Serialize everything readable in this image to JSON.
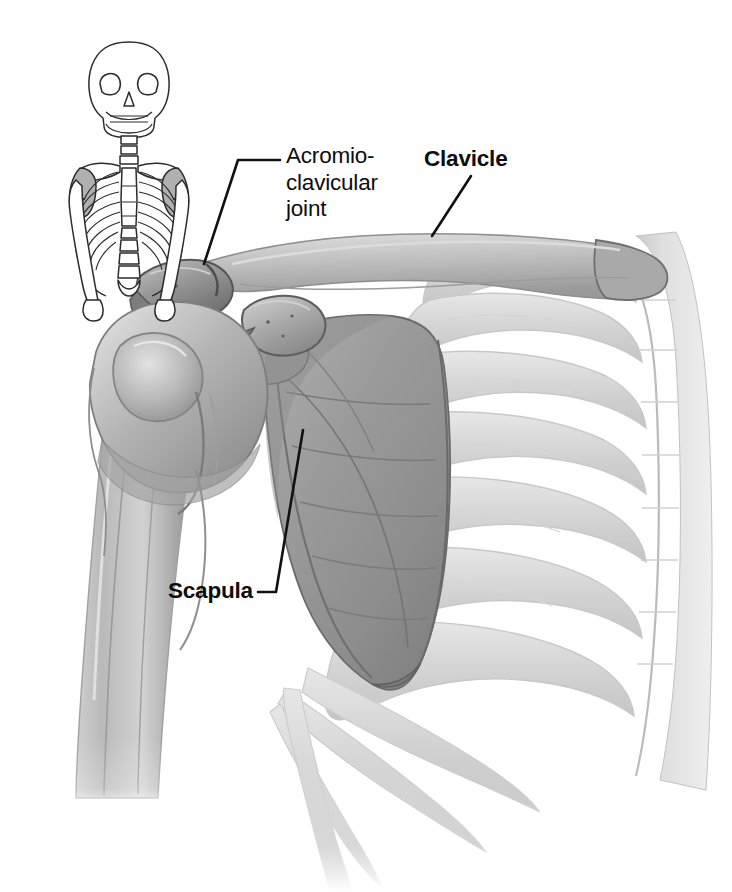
{
  "figure": {
    "style": "grayscale pencil medical illustration",
    "background_color": "#ffffff",
    "width": 732,
    "height": 892
  },
  "labels": [
    {
      "id": "acromioclavicular-joint",
      "text": "Acromio-\nclavicular\njoint",
      "weight": "regular",
      "color": "#0d0d0d"
    },
    {
      "id": "clavicle",
      "text": "Clavicle",
      "weight": "bold",
      "color": "#0d0d0d"
    },
    {
      "id": "scapula",
      "text": "Scapula",
      "weight": "bold",
      "color": "#0d0d0d"
    }
  ],
  "leader_lines": [
    {
      "id": "acromioclavicular-joint-leader",
      "from_label": "Acromio-clavicular joint",
      "points": "280,160 238,160 204,264",
      "color": "#111111"
    },
    {
      "id": "clavicle-leader",
      "from_label": "Clavicle",
      "points": "471,176 432,236",
      "color": "#111111"
    },
    {
      "id": "scapula-leader",
      "from_label": "Scapula",
      "points": "258,592 276,592 303,430",
      "color": "#111111"
    }
  ],
  "structures": [
    {
      "id": "humerus",
      "name": "Humerus",
      "tone": "#b5b5b5"
    },
    {
      "id": "humeral-head",
      "name": "Head of humerus",
      "tone": "#a8a8a8"
    },
    {
      "id": "greater-tubercle",
      "name": "Greater tubercle",
      "tone": "#9e9e9e"
    },
    {
      "id": "acromion",
      "name": "Acromion",
      "tone": "#8a8a8a"
    },
    {
      "id": "coracoid-process",
      "name": "Coracoid process",
      "tone": "#9c9c9c"
    },
    {
      "id": "clavicle-bone",
      "name": "Clavicle",
      "tone": "#bcbcbc"
    },
    {
      "id": "scapula-body",
      "name": "Scapula",
      "tone": "#9a9a9a"
    },
    {
      "id": "ribs",
      "name": "Ribs",
      "tone": "#d8d8d8"
    },
    {
      "id": "spine",
      "name": "Vertebral column",
      "tone": "#dcdcdc"
    }
  ],
  "inset": {
    "id": "skeleton-inset",
    "name": "Upper body skeleton orientation diagram",
    "stroke_color": "#2b2b2b",
    "fill_color": "#ffffff",
    "highlight_color": "#b0b0b0",
    "highlight_region": "scapulae",
    "parts": [
      "skull",
      "mandible",
      "cervical spine",
      "clavicles",
      "scapulae",
      "ribcage",
      "sternum",
      "lumbar spine",
      "humeri"
    ]
  },
  "palette": {
    "ink": "#0d0d0d",
    "bone_light": "#dedede",
    "bone_mid": "#b2b2b2",
    "bone_dark": "#8a8a8a",
    "shadow": "#6e6e6e",
    "paper": "#ffffff"
  }
}
